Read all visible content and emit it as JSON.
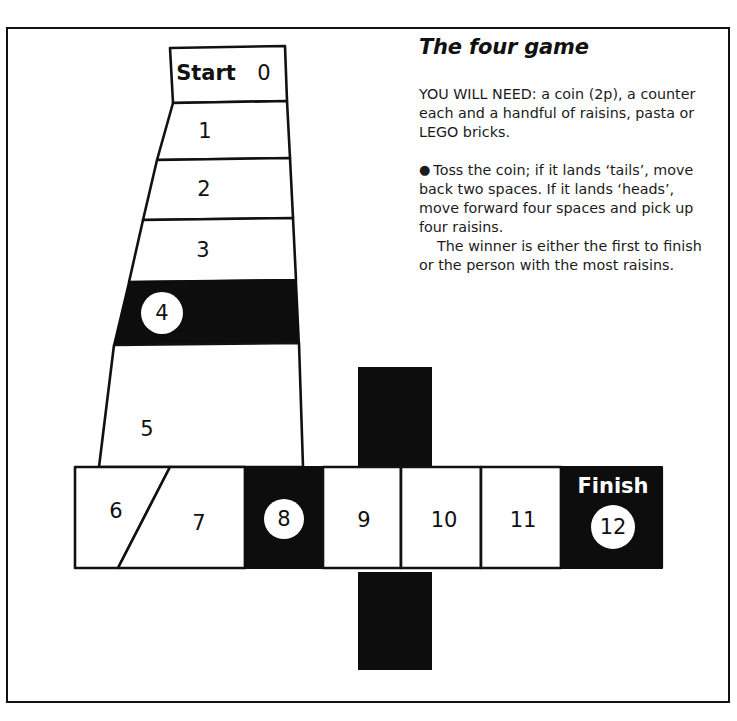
{
  "page": {
    "title": "The four game"
  },
  "instructions": {
    "need_label": "YOU WILL NEED: a coin (2p), a counter each and a handful of raisins, pasta or LEGO bricks.",
    "bullet_glyph": "●",
    "rule": "Toss the coin; if it lands ‘tails’, move back two spaces. If it lands ‘heads’, move forward four spaces and pick up four raisins.",
    "winner": "The winner is either the first to finish or the person with the most raisins."
  },
  "board": {
    "start_label": "Start",
    "finish_label": "Finish",
    "colors": {
      "ink": "#111111",
      "black_square": "#0d0d0d",
      "paper": "#ffffff"
    },
    "cells": [
      {
        "number": "0",
        "style": "white",
        "coin": false,
        "label": "Start"
      },
      {
        "number": "1",
        "style": "white",
        "coin": false,
        "label": ""
      },
      {
        "number": "2",
        "style": "white",
        "coin": false,
        "label": ""
      },
      {
        "number": "3",
        "style": "white",
        "coin": false,
        "label": ""
      },
      {
        "number": "4",
        "style": "black",
        "coin": true,
        "label": ""
      },
      {
        "number": "5",
        "style": "white",
        "coin": false,
        "label": ""
      },
      {
        "number": "6",
        "style": "white",
        "coin": false,
        "label": ""
      },
      {
        "number": "7",
        "style": "white",
        "coin": false,
        "label": ""
      },
      {
        "number": "8",
        "style": "black",
        "coin": true,
        "label": ""
      },
      {
        "number": "9",
        "style": "white",
        "coin": false,
        "label": ""
      },
      {
        "number": "10",
        "style": "white",
        "coin": false,
        "label": ""
      },
      {
        "number": "11",
        "style": "white",
        "coin": false,
        "label": ""
      },
      {
        "number": "12",
        "style": "black",
        "coin": true,
        "label": "Finish"
      }
    ]
  }
}
